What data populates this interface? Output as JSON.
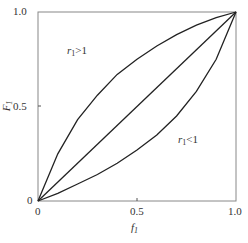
{
  "chart_data": {
    "type": "line",
    "title": "",
    "xlabel": "f1",
    "ylabel": "F1",
    "xlim": [
      0,
      1.0
    ],
    "ylim": [
      0,
      1.0
    ],
    "x_ticks": [
      "0",
      "0.5",
      "1.0"
    ],
    "y_ticks": [
      "0",
      "0.5",
      "1.0"
    ],
    "grid": false,
    "series": [
      {
        "name": "r1>1",
        "x": [
          0,
          0.1,
          0.2,
          0.3,
          0.4,
          0.5,
          0.6,
          0.7,
          0.8,
          0.9,
          1.0
        ],
        "values": [
          0,
          0.25,
          0.43,
          0.56,
          0.67,
          0.75,
          0.82,
          0.88,
          0.93,
          0.97,
          1.0
        ]
      },
      {
        "name": "r1=1",
        "x": [
          0,
          0.5,
          1.0
        ],
        "values": [
          0,
          0.5,
          1.0
        ]
      },
      {
        "name": "r1<1",
        "x": [
          0,
          0.1,
          0.2,
          0.3,
          0.4,
          0.5,
          0.6,
          0.7,
          0.8,
          0.9,
          1.0
        ],
        "values": [
          0,
          0.04,
          0.09,
          0.14,
          0.2,
          0.27,
          0.35,
          0.45,
          0.58,
          0.75,
          1.0
        ]
      }
    ],
    "annotations": [
      "r1>1",
      "r1<1"
    ]
  },
  "labels": {
    "y_tick_top": "1.0",
    "y_tick_mid": "0.5",
    "y_tick_zero": "0",
    "x_tick_zero": "0",
    "x_tick_mid": "0.5",
    "x_tick_right": "1.0",
    "ylabel_main": "F",
    "ylabel_sub": "1",
    "xlabel_main": "f",
    "xlabel_sub": "1",
    "ann_upper_main": "r",
    "ann_upper_sub": "1",
    "ann_upper_rest": ">1",
    "ann_lower_main": "r",
    "ann_lower_sub": "1",
    "ann_lower_rest": "<1"
  }
}
